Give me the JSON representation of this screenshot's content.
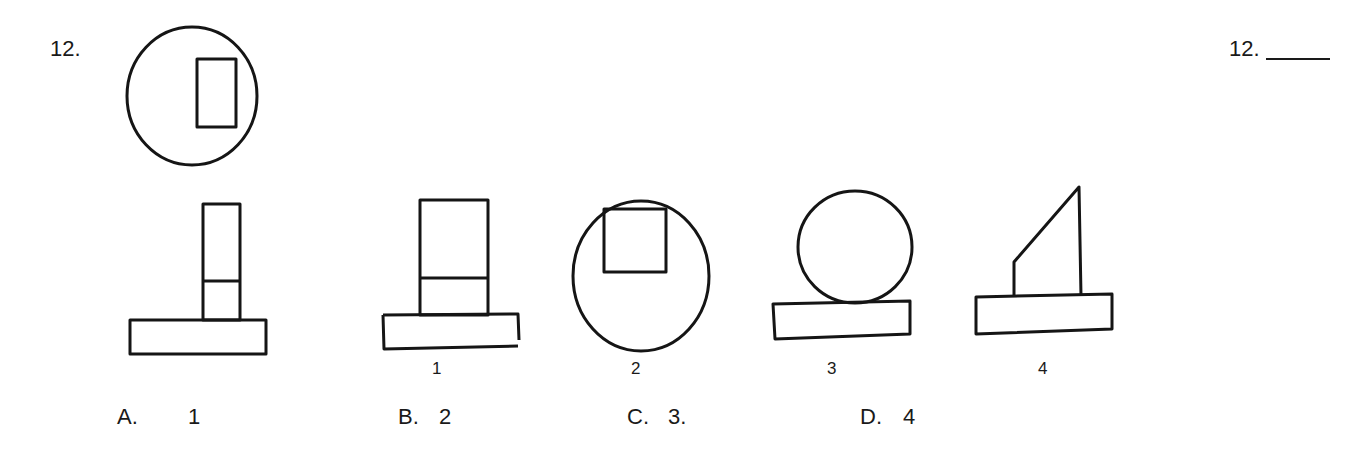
{
  "question": {
    "number": "12.",
    "answer_label": "12.",
    "answer_blank": ""
  },
  "figures": {
    "reference": {
      "name": "top-view",
      "description": "circle with rectangle near right edge"
    },
    "views": [
      {
        "label": "",
        "description": "narrow tall rectangle with dividing line on wide base"
      },
      {
        "label": "1",
        "description": "wider rectangle with dividing line on wide base"
      },
      {
        "label": "2",
        "description": "ellipse with square notch at top"
      },
      {
        "label": "3",
        "description": "circle resting on rectangular base"
      },
      {
        "label": "4",
        "description": "slanted trapezoid shape on rectangular base"
      }
    ]
  },
  "choices": [
    {
      "letter": "A.",
      "value": "1"
    },
    {
      "letter": "B.",
      "value": "2"
    },
    {
      "letter": "C.",
      "value": "3."
    },
    {
      "letter": "D.",
      "value": "4"
    }
  ]
}
